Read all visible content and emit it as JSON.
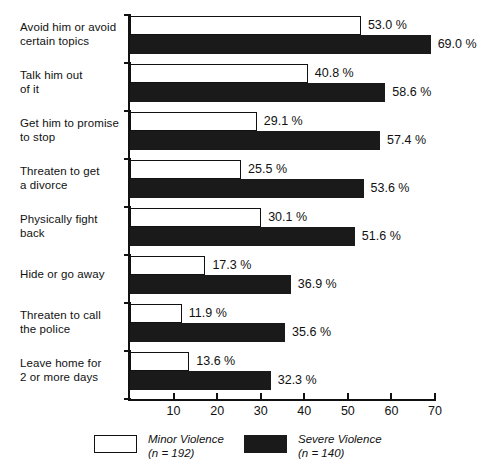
{
  "chart_data": {
    "type": "bar",
    "orientation": "horizontal",
    "title": "",
    "subtitle": "",
    "xlabel": "",
    "ylabel": "",
    "xlim": [
      0,
      70
    ],
    "grid": false,
    "legend_position": "bottom",
    "value_suffix": " %",
    "categories": [
      "Avoid him or avoid\ncertain topics",
      "Talk him out\nof it",
      "Get him to promise\nto stop",
      "Threaten to get\na divorce",
      "Physically fight\nback",
      "Hide or go away",
      "Threaten to call\nthe police",
      "Leave home for\n2 or more days"
    ],
    "xticks": [
      10,
      20,
      30,
      40,
      50,
      60,
      70
    ],
    "xtick_labels": [
      "10",
      "20",
      "30",
      "40",
      "50",
      "60",
      "70"
    ],
    "series": [
      {
        "name": "Minor Violence",
        "n": 192,
        "legend_label": "Minor Violence",
        "legend_sublabel": "(n = 192)",
        "color": "#ffffff",
        "edge_color": "#111111",
        "values": [
          53.0,
          40.8,
          29.1,
          25.5,
          30.1,
          17.3,
          11.9,
          13.6
        ],
        "value_labels": [
          "53.0 %",
          "40.8 %",
          "29.1 %",
          "25.5 %",
          "30.1 %",
          "17.3 %",
          "11.9 %",
          "13.6 %"
        ]
      },
      {
        "name": "Severe Violence",
        "n": 140,
        "legend_label": "Severe Violence",
        "legend_sublabel": "(n = 140)",
        "color": "#1a1a1a",
        "edge_color": "#1a1a1a",
        "values": [
          69.0,
          58.6,
          57.4,
          53.6,
          51.6,
          36.9,
          35.6,
          32.3
        ],
        "value_labels": [
          "69.0 %",
          "58.6 %",
          "57.4 %",
          "53.6 %",
          "51.6 %",
          "36.9 %",
          "35.6 %",
          "32.3 %"
        ]
      }
    ]
  },
  "legend": {
    "items": [
      {
        "label": "Minor Violence",
        "n_prefix": "(",
        "n_italic": "n",
        "n_value": " = 192)",
        "swatch": "minor"
      },
      {
        "label": "Severe Violence",
        "n_prefix": "(",
        "n_italic": "n",
        "n_value": " = 140)",
        "swatch": "severe"
      }
    ]
  }
}
